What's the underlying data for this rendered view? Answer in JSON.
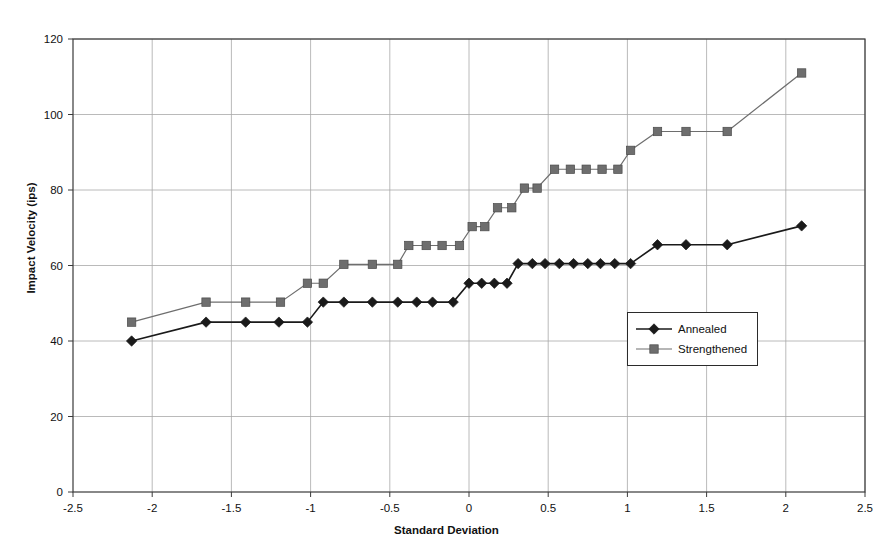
{
  "chart_data": {
    "type": "line",
    "title": "",
    "xlabel": "Standard Deviation",
    "ylabel": "Impact Velocity (ips)",
    "xlim": [
      -2.5,
      2.5
    ],
    "ylim": [
      0,
      120
    ],
    "xticks": [
      "-2.5",
      "-2",
      "-1.5",
      "-1",
      "-0.5",
      "0",
      "0.5",
      "1",
      "1.5",
      "2",
      "2.5"
    ],
    "xtick_values": [
      -2.5,
      -2,
      -1.5,
      -1,
      -0.5,
      0,
      0.5,
      1,
      1.5,
      2,
      2.5
    ],
    "yticks": [
      "0",
      "20",
      "40",
      "60",
      "80",
      "100",
      "120"
    ],
    "ytick_values": [
      0,
      20,
      40,
      60,
      80,
      100,
      120
    ],
    "grid": true,
    "grid_color": "#a8a8a8",
    "legend_position": "center-right",
    "series": [
      {
        "name": "Annealed",
        "marker": "diamond",
        "color": "#1a1a1a",
        "points": [
          [
            -2.13,
            40.0
          ],
          [
            -1.66,
            45.0
          ],
          [
            -1.41,
            45.0
          ],
          [
            -1.2,
            45.0
          ],
          [
            -1.02,
            45.0
          ],
          [
            -0.92,
            50.3
          ],
          [
            -0.79,
            50.3
          ],
          [
            -0.61,
            50.3
          ],
          [
            -0.45,
            50.3
          ],
          [
            -0.33,
            50.3
          ],
          [
            -0.23,
            50.3
          ],
          [
            -0.1,
            50.3
          ],
          [
            0.0,
            55.3
          ],
          [
            0.08,
            55.3
          ],
          [
            0.16,
            55.3
          ],
          [
            0.24,
            55.3
          ],
          [
            0.31,
            60.5
          ],
          [
            0.4,
            60.5
          ],
          [
            0.48,
            60.5
          ],
          [
            0.57,
            60.5
          ],
          [
            0.66,
            60.5
          ],
          [
            0.75,
            60.5
          ],
          [
            0.83,
            60.5
          ],
          [
            0.92,
            60.5
          ],
          [
            1.02,
            60.5
          ],
          [
            1.19,
            65.5
          ],
          [
            1.37,
            65.5
          ],
          [
            1.63,
            65.5
          ],
          [
            2.1,
            70.5
          ]
        ]
      },
      {
        "name": "Strengthened",
        "marker": "square",
        "color": "#6e6e6e",
        "points": [
          [
            -2.13,
            45.0
          ],
          [
            -1.66,
            50.3
          ],
          [
            -1.41,
            50.3
          ],
          [
            -1.19,
            50.3
          ],
          [
            -1.02,
            55.3
          ],
          [
            -0.92,
            55.3
          ],
          [
            -0.79,
            60.3
          ],
          [
            -0.61,
            60.3
          ],
          [
            -0.45,
            60.3
          ],
          [
            -0.38,
            65.3
          ],
          [
            -0.27,
            65.3
          ],
          [
            -0.17,
            65.3
          ],
          [
            -0.06,
            65.3
          ],
          [
            0.02,
            70.3
          ],
          [
            0.1,
            70.3
          ],
          [
            0.18,
            75.3
          ],
          [
            0.27,
            75.3
          ],
          [
            0.35,
            80.5
          ],
          [
            0.43,
            80.5
          ],
          [
            0.54,
            85.5
          ],
          [
            0.64,
            85.5
          ],
          [
            0.74,
            85.5
          ],
          [
            0.84,
            85.5
          ],
          [
            0.94,
            85.5
          ],
          [
            1.02,
            90.5
          ],
          [
            1.19,
            95.5
          ],
          [
            1.37,
            95.5
          ],
          [
            1.63,
            95.5
          ],
          [
            2.1,
            111.0
          ]
        ]
      }
    ]
  },
  "legend": {
    "entries": [
      {
        "label": "Annealed"
      },
      {
        "label": "Strengthened"
      }
    ]
  }
}
